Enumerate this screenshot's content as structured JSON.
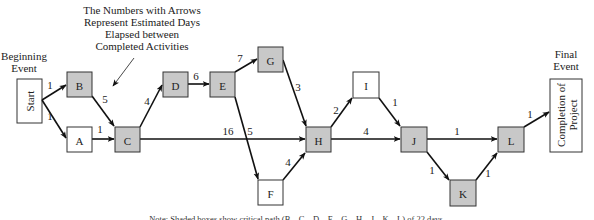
{
  "annotation": {
    "lines": [
      "The Numbers with Arrows",
      "Represent Estimated Days",
      "Elapsed between",
      "Completed Activities"
    ]
  },
  "begin_event": {
    "title_lines": [
      "Beginning",
      "Event"
    ],
    "box_label": "Start"
  },
  "final_event": {
    "title_lines": [
      "Final",
      "Event"
    ],
    "box_lines": [
      "Completion of",
      "Project"
    ]
  },
  "colors": {
    "critical_fill": "#c8c8c8",
    "normal_fill": "#ffffff",
    "stroke": "#333333"
  },
  "nodes": [
    {
      "id": "B",
      "label": "B",
      "critical": true,
      "x": 67,
      "y": 72,
      "w": 25,
      "h": 25
    },
    {
      "id": "A",
      "label": "A",
      "critical": false,
      "x": 67,
      "y": 127,
      "w": 25,
      "h": 25
    },
    {
      "id": "C",
      "label": "C",
      "critical": true,
      "x": 115,
      "y": 127,
      "w": 25,
      "h": 25
    },
    {
      "id": "D",
      "label": "D",
      "critical": true,
      "x": 163,
      "y": 72,
      "w": 25,
      "h": 25
    },
    {
      "id": "E",
      "label": "E",
      "critical": true,
      "x": 210,
      "y": 72,
      "w": 25,
      "h": 25
    },
    {
      "id": "G",
      "label": "G",
      "critical": true,
      "x": 258,
      "y": 47,
      "w": 25,
      "h": 25
    },
    {
      "id": "F",
      "label": "F",
      "critical": false,
      "x": 258,
      "y": 180,
      "w": 25,
      "h": 25
    },
    {
      "id": "H",
      "label": "H",
      "critical": true,
      "x": 306,
      "y": 127,
      "w": 25,
      "h": 25
    },
    {
      "id": "I",
      "label": "I",
      "critical": false,
      "x": 353,
      "y": 72,
      "w": 26,
      "h": 26
    },
    {
      "id": "J",
      "label": "J",
      "critical": true,
      "x": 401,
      "y": 127,
      "w": 26,
      "h": 25
    },
    {
      "id": "K",
      "label": "K",
      "critical": true,
      "x": 450,
      "y": 180,
      "w": 26,
      "h": 26
    },
    {
      "id": "L",
      "label": "L",
      "critical": true,
      "x": 498,
      "y": 127,
      "w": 26,
      "h": 25
    }
  ],
  "edges": [
    {
      "from": "Start",
      "to": "B",
      "days": "1",
      "x1": 42,
      "y1": 100,
      "x2": 66,
      "y2": 85,
      "lx": 50,
      "ly": 89
    },
    {
      "from": "Start",
      "to": "A",
      "days": "1",
      "x1": 42,
      "y1": 100,
      "x2": 66,
      "y2": 138,
      "lx": 50,
      "ly": 120
    },
    {
      "from": "B",
      "to": "C",
      "days": "5",
      "x1": 92,
      "y1": 96,
      "x2": 114,
      "y2": 126,
      "lx": 105,
      "ly": 103
    },
    {
      "from": "A",
      "to": "C",
      "days": "1",
      "x1": 92,
      "y1": 139,
      "x2": 114,
      "y2": 139,
      "lx": 100,
      "ly": 133
    },
    {
      "from": "C",
      "to": "D",
      "days": "4",
      "x1": 140,
      "y1": 127,
      "x2": 162,
      "y2": 85,
      "lx": 147,
      "ly": 105
    },
    {
      "from": "C",
      "to": "H",
      "days": "16",
      "x1": 140,
      "y1": 139,
      "x2": 305,
      "y2": 139,
      "lx": 228,
      "ly": 135
    },
    {
      "from": "D",
      "to": "E",
      "days": "6",
      "x1": 188,
      "y1": 84,
      "x2": 209,
      "y2": 84,
      "lx": 196,
      "ly": 80
    },
    {
      "from": "E",
      "to": "G",
      "days": "7",
      "x1": 235,
      "y1": 72,
      "x2": 257,
      "y2": 59,
      "lx": 240,
      "ly": 62
    },
    {
      "from": "E",
      "to": "F",
      "days": "5",
      "x1": 235,
      "y1": 97,
      "x2": 258,
      "y2": 179,
      "lx": 250,
      "ly": 135
    },
    {
      "from": "G",
      "to": "H",
      "days": "3",
      "x1": 283,
      "y1": 60,
      "x2": 306,
      "y2": 126,
      "lx": 298,
      "ly": 91
    },
    {
      "from": "F",
      "to": "H",
      "days": "4",
      "x1": 283,
      "y1": 180,
      "x2": 305,
      "y2": 153,
      "lx": 288,
      "ly": 166
    },
    {
      "from": "H",
      "to": "I",
      "days": "2",
      "x1": 331,
      "y1": 127,
      "x2": 352,
      "y2": 98,
      "lx": 336,
      "ly": 114
    },
    {
      "from": "H",
      "to": "J",
      "days": "4",
      "x1": 331,
      "y1": 139,
      "x2": 400,
      "y2": 139,
      "lx": 366,
      "ly": 135
    },
    {
      "from": "I",
      "to": "J",
      "days": "1",
      "x1": 379,
      "y1": 98,
      "x2": 400,
      "y2": 126,
      "lx": 395,
      "ly": 106
    },
    {
      "from": "J",
      "to": "L",
      "days": "1",
      "x1": 427,
      "y1": 139,
      "x2": 497,
      "y2": 139,
      "lx": 457,
      "ly": 135
    },
    {
      "from": "J",
      "to": "K",
      "days": "1",
      "x1": 427,
      "y1": 152,
      "x2": 449,
      "y2": 180,
      "lx": 432,
      "ly": 174
    },
    {
      "from": "K",
      "to": "L",
      "days": "1",
      "x1": 476,
      "y1": 180,
      "x2": 497,
      "y2": 153,
      "lx": 488,
      "ly": 177
    },
    {
      "from": "L",
      "to": "End",
      "days": "1",
      "x1": 524,
      "y1": 127,
      "x2": 549,
      "y2": 112,
      "lx": 530,
      "ly": 118
    }
  ],
  "note": "Note: Shaded boxes show critical path (B—C—D—E—G—H—J—K—L) of 22 days."
}
